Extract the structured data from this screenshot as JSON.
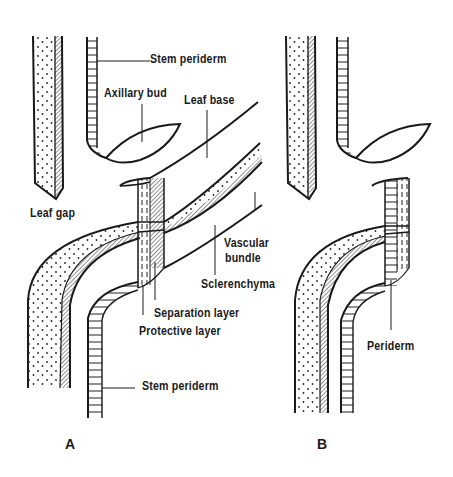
{
  "figure": {
    "panels": [
      {
        "id": "A",
        "label": "A"
      },
      {
        "id": "B",
        "label": "B"
      }
    ],
    "labels_A": {
      "stem_periderm_top": "Stem periderm",
      "axillary_bud": "Axillary bud",
      "leaf_base": "Leaf base",
      "leaf_gap": "Leaf gap",
      "vascular_bundle_line1": "Vascular",
      "vascular_bundle_line2": "bundle",
      "sclerenchyma": "Sclerenchyma",
      "separation_layer": "Separation layer",
      "protective_layer": "Protective layer",
      "stem_periderm_bottom": "Stem periderm"
    },
    "labels_B": {
      "periderm": "Periderm"
    },
    "colors": {
      "ink": "#1a1a1a",
      "background": "#ffffff"
    }
  }
}
